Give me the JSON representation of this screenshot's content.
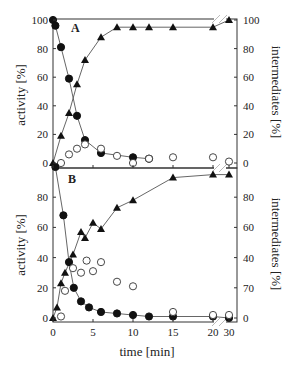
{
  "chart_data": [
    {
      "panel": "A",
      "type": "scatter",
      "title": "",
      "panel_label": "A",
      "xlabel": "time [min]",
      "ylabel_left": "activity [%]",
      "ylabel_right": "intermediates [%]",
      "xlim": [
        0,
        30
      ],
      "x_axis_break": "between 20 and 30",
      "ylim": [
        0,
        100
      ],
      "y_ticks_left": [
        "0",
        "20",
        "40",
        "60",
        "80",
        "100"
      ],
      "y_ticks_right": [
        "0",
        "20",
        "40",
        "60",
        "80",
        "100"
      ],
      "grid": false,
      "series": [
        {
          "name": "activity",
          "marker": "filled-circle",
          "axis": "left",
          "x": [
            0,
            0.3,
            1,
            2,
            3,
            4,
            6,
            10,
            12
          ],
          "y": [
            100,
            96,
            81,
            59,
            33,
            16,
            7,
            4,
            3
          ]
        },
        {
          "name": "intermediate (open circles)",
          "marker": "open-circle",
          "axis": "right",
          "x": [
            1,
            2,
            3,
            4,
            6,
            8,
            10,
            12,
            15,
            20,
            30
          ],
          "y": [
            0,
            6,
            10,
            13,
            10,
            5,
            0,
            3,
            4,
            4,
            1
          ]
        },
        {
          "name": "product (triangles)",
          "marker": "filled-triangle",
          "axis": "right",
          "x": [
            0,
            1,
            2,
            3,
            4,
            6,
            8,
            10,
            12,
            15,
            20,
            30
          ],
          "y": [
            0,
            19,
            35,
            55,
            72,
            88,
            95,
            95,
            95,
            95,
            95,
            100
          ]
        }
      ]
    },
    {
      "panel": "B",
      "type": "scatter",
      "title": "",
      "panel_label": "B",
      "xlabel": "time [min]",
      "ylabel_left": "activity [%]",
      "ylabel_right": "intermediates [%]",
      "xlim": [
        0,
        30
      ],
      "x_axis_break": "between 20 and 30",
      "x_ticks": [
        "0",
        "5",
        "10",
        "15",
        "20",
        "30"
      ],
      "ylim": [
        0,
        100
      ],
      "y_ticks_left": [
        "0",
        "20",
        "40",
        "60",
        "80"
      ],
      "y_ticks_right": [
        "0",
        "70",
        "40",
        "60",
        "80"
      ],
      "grid": false,
      "series": [
        {
          "name": "activity",
          "marker": "filled-circle",
          "axis": "left",
          "x": [
            0.3,
            1.3,
            2,
            2.6,
            3.5,
            4.5,
            6,
            8,
            10,
            12,
            15,
            20,
            30
          ],
          "y": [
            100,
            68,
            37,
            20,
            11,
            7,
            4,
            3,
            2,
            1,
            1,
            1,
            0
          ]
        },
        {
          "name": "intermediate (open circles)",
          "marker": "open-circle",
          "axis": "right",
          "x": [
            1,
            1.5,
            2.5,
            3.5,
            4.2,
            5,
            6,
            8,
            10,
            15,
            20,
            30
          ],
          "y": [
            1,
            18,
            33,
            30,
            38,
            31,
            37,
            24,
            21,
            4,
            2,
            2
          ]
        },
        {
          "name": "product (triangles)",
          "marker": "filled-triangle",
          "axis": "right",
          "x": [
            0,
            0.5,
            1,
            1.5,
            2.5,
            3.5,
            4,
            5,
            6,
            8,
            10,
            15,
            20,
            30
          ],
          "y": [
            0,
            7,
            23,
            30,
            42,
            57,
            53,
            63,
            59,
            73,
            78,
            93,
            95,
            95
          ]
        }
      ]
    }
  ]
}
